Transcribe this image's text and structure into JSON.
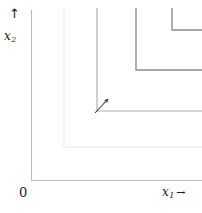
{
  "figure": {
    "background": "#ffffff",
    "width": 202,
    "height": 213
  },
  "axes": {
    "origin_label": "0",
    "x_label": "x",
    "x_subscript": "1",
    "x_arrow": "→",
    "y_label": "x",
    "y_subscript": "2",
    "y_arrow": "↑",
    "axis_color": "#b9b9b9",
    "x_axis": {
      "y": 180,
      "x_start": 31,
      "x_end": 202
    },
    "y_axis": {
      "x": 31,
      "y_start": 10,
      "y_end": 180
    }
  },
  "annotation": {
    "arrow_name": "gradient-arrow",
    "arrow_color": "#3a3a3a",
    "from_x": 95,
    "from_y": 113,
    "to_x": 108,
    "to_y": 99
  },
  "chart_data": {
    "type": "line",
    "title": "",
    "xlabel": "x₁",
    "ylabel": "x₂",
    "grid": false,
    "legend": "none",
    "series": [
      {
        "name": "curve-outer",
        "color": "#efefef",
        "width": 1.4,
        "kink_x": 64,
        "kink_y": 147,
        "points": [
          [
            64,
            8
          ],
          [
            64,
            147
          ],
          [
            202,
            147
          ]
        ]
      },
      {
        "name": "curve-middle",
        "color": "#b0b0b0",
        "width": 1.2,
        "kink_x": 97,
        "kink_y": 111,
        "points": [
          [
            97,
            8
          ],
          [
            97,
            111
          ],
          [
            202,
            111
          ]
        ]
      },
      {
        "name": "curve-inner",
        "color": "#8d8d8d",
        "width": 1.4,
        "kink_x": 136,
        "kink_y": 70,
        "points": [
          [
            136,
            8
          ],
          [
            136,
            70
          ],
          [
            202,
            70
          ]
        ]
      },
      {
        "name": "curve-innermost",
        "color": "#8d8d8d",
        "width": 1.4,
        "kink_x": 172,
        "kink_y": 30,
        "points": [
          [
            172,
            8
          ],
          [
            172,
            30
          ],
          [
            202,
            30
          ]
        ]
      }
    ]
  }
}
